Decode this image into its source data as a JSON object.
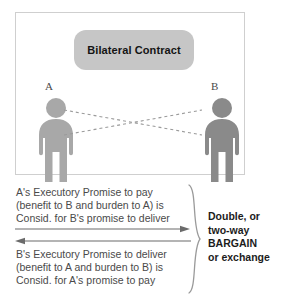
{
  "diagram": {
    "title": "Bilateral Contract",
    "party_a_label": "A",
    "party_b_label": "B",
    "colors": {
      "title_box": "#c6c6c6",
      "figure_a": "#a8a8a8",
      "figure_b": "#8a8a8a",
      "panel_border": "#cfcfcf",
      "connector": "#9a9a9a"
    }
  },
  "exchange": {
    "promise_ab": {
      "line1": "A's Executory Promise to pay",
      "line2": "(benefit to B and burden to A) is",
      "line3": "Consid. for B's promise to deliver"
    },
    "promise_ba": {
      "line1": "B's Executory Promise to deliver",
      "line2": "(benefit to A and burden to B) is",
      "line3": "Consid. for A's promise to pay"
    },
    "bargain": {
      "line1": "Double, or",
      "line2": "two-way",
      "line3": "BARGAIN",
      "line4": "or exchange"
    }
  }
}
